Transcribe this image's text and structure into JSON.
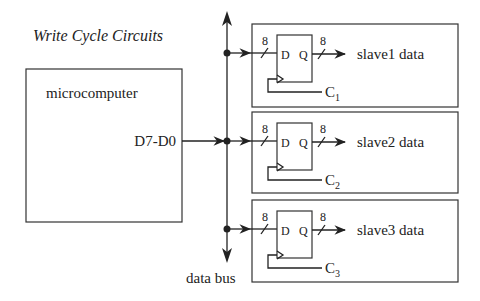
{
  "title": "Write Cycle Circuits",
  "master": {
    "label": "microcomputer",
    "port": "D7-D0"
  },
  "bus": {
    "label": "data bus"
  },
  "slaves": [
    {
      "input_width": "8",
      "d_label": "D",
      "q_label": "Q",
      "output_width": "8",
      "output_label": "slave1 data",
      "clock_label": "C",
      "clock_sub": "1"
    },
    {
      "input_width": "8",
      "d_label": "D",
      "q_label": "Q",
      "output_width": "8",
      "output_label": "slave2 data",
      "clock_label": "C",
      "clock_sub": "2"
    },
    {
      "input_width": "8",
      "d_label": "D",
      "q_label": "Q",
      "output_width": "8",
      "output_label": "slave3 data",
      "clock_label": "C",
      "clock_sub": "3"
    }
  ],
  "colors": {
    "line": "#222222",
    "background": "#ffffff"
  }
}
